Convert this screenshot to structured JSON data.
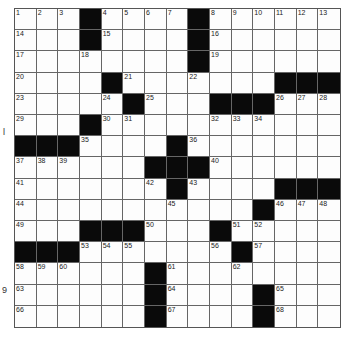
{
  "puzzle": {
    "rows": 15,
    "cols": 15,
    "grid": [
      [
        "1",
        "2",
        "3",
        "#",
        "4",
        "5",
        "6",
        "7",
        "#",
        "8",
        "9",
        "10",
        "11",
        "12",
        "13"
      ],
      [
        "14",
        "",
        "",
        "#",
        "15",
        "",
        "",
        "",
        "#",
        "16",
        "",
        "",
        "",
        "",
        ""
      ],
      [
        "17",
        "",
        "",
        "18",
        "",
        "",
        "",
        "",
        "#",
        "19",
        "",
        "",
        "",
        "",
        ""
      ],
      [
        "20",
        "",
        "",
        "",
        "#",
        "21",
        "",
        "",
        "22",
        "",
        "",
        "",
        "#",
        "#",
        "#"
      ],
      [
        "23",
        "",
        "",
        "",
        "24",
        "#",
        "25",
        "",
        "",
        "#",
        "#",
        "#",
        "26",
        "27",
        "28"
      ],
      [
        "29",
        "",
        "",
        "#",
        "30",
        "31",
        "",
        "",
        "",
        "32",
        "33",
        "34",
        "",
        "",
        ""
      ],
      [
        "#",
        "#",
        "#",
        "35",
        "",
        "",
        "",
        "#",
        "36",
        "",
        "",
        "",
        "",
        "",
        ""
      ],
      [
        "37",
        "38",
        "39",
        "",
        "",
        "",
        "#",
        "#",
        "#",
        "40",
        "",
        "",
        "",
        "",
        ""
      ],
      [
        "41",
        "",
        "",
        "",
        "",
        "",
        "42",
        "#",
        "43",
        "",
        "",
        "",
        "#",
        "#",
        "#"
      ],
      [
        "44",
        "",
        "",
        "",
        "",
        "",
        "",
        "45",
        "",
        "",
        "",
        "#",
        "46",
        "47",
        "48"
      ],
      [
        "49",
        "",
        "",
        "#",
        "#",
        "#",
        "50",
        "",
        "",
        "#",
        "51",
        "52",
        "",
        "",
        ""
      ],
      [
        "#",
        "#",
        "#",
        "53",
        "54",
        "55",
        "",
        "",
        "",
        "56",
        "#",
        "57",
        "",
        "",
        ""
      ],
      [
        "58",
        "59",
        "60",
        "",
        "",
        "",
        "#",
        "61",
        "",
        "",
        "62",
        "",
        "",
        "",
        ""
      ],
      [
        "63",
        "",
        "",
        "",
        "",
        "",
        "#",
        "64",
        "",
        "",
        "",
        "#",
        "65",
        "",
        ""
      ],
      [
        "66",
        "",
        "",
        "",
        "",
        "",
        "#",
        "67",
        "",
        "",
        "",
        "#",
        "68",
        "",
        ""
      ]
    ]
  },
  "margin_fragments": [
    {
      "text": "l",
      "x": 3,
      "y": 128
    },
    {
      "text": "9",
      "x": 2,
      "y": 286
    }
  ]
}
